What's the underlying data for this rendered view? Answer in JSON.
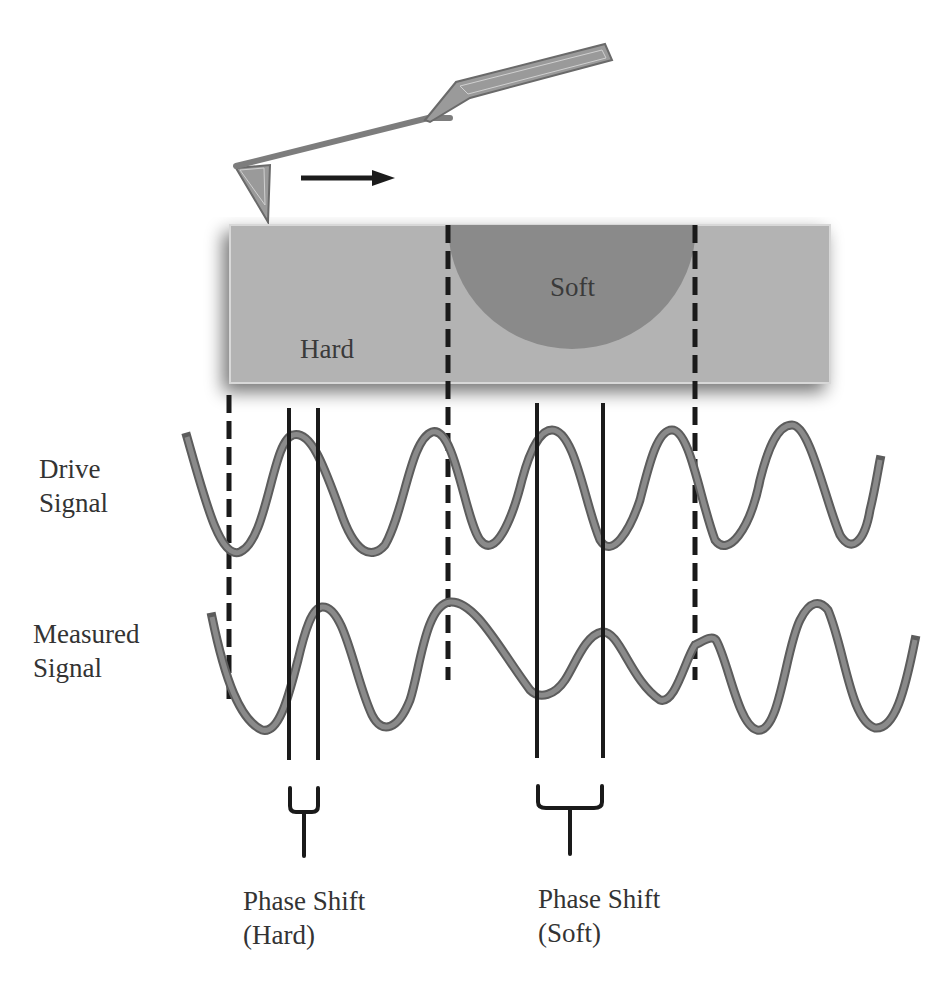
{
  "diagram": {
    "sample": {
      "hard_label": "Hard",
      "soft_label": "Soft"
    },
    "signals": {
      "drive_label_line1": "Drive",
      "drive_label_line2": "Signal",
      "measured_label_line1": "Measured",
      "measured_label_line2": "Signal"
    },
    "phase_shifts": {
      "hard_line1": "Phase Shift",
      "hard_line2": "(Hard)",
      "soft_line1": "Phase Shift",
      "soft_line2": "(Soft)"
    },
    "scan_direction": "right-arrow",
    "colors": {
      "substrate": "#b3b3b3",
      "soft_region": "#8a8a8a",
      "wave": "#7a7a7a",
      "wave_outline": "#5a5a5a",
      "lines": "#1a1a1a",
      "cantilever": "#9a9a9a"
    }
  }
}
